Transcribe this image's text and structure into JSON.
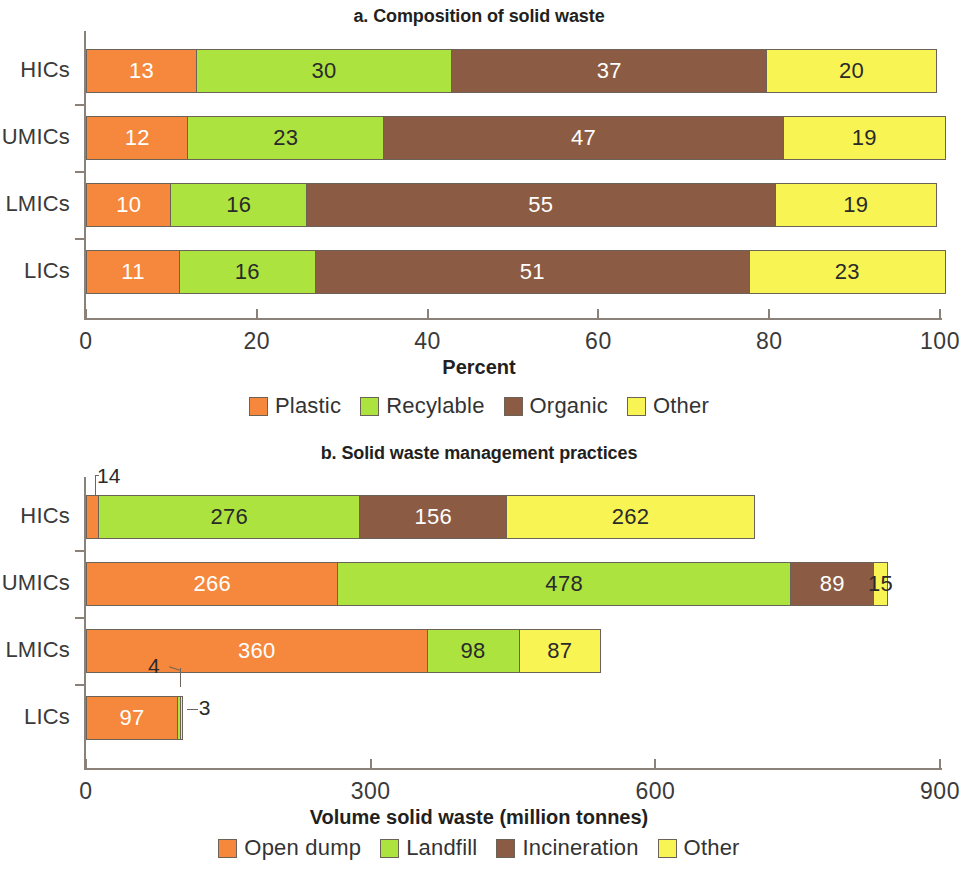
{
  "figure": {
    "background": "#ffffff",
    "palette": {
      "plastic_open_dump": "#F5883C",
      "recyclable_landfill": "#ADE33F",
      "organic_incineration": "#8B5B43",
      "other": "#F8F453",
      "axis": "#8A8279",
      "text": "#333333",
      "value_dark": "#2A2A2A",
      "value_light": "#FFFFFF"
    }
  },
  "panel_a": {
    "title": "a. Composition of solid waste",
    "xlabel": "Percent",
    "categories": [
      "HICs",
      "UMICs",
      "LMICs",
      "LICs"
    ],
    "xticks": [
      "0",
      "20",
      "40",
      "60",
      "80",
      "100"
    ],
    "legend": [
      {
        "label": "Plastic",
        "color": "#F5883C"
      },
      {
        "label": "Recylable",
        "color": "#ADE33F"
      },
      {
        "label": "Organic",
        "color": "#8B5B43"
      },
      {
        "label": "Other",
        "color": "#F8F453"
      }
    ]
  },
  "panel_b": {
    "title": "b. Solid waste management practices",
    "xlabel": "Volume solid waste (million tonnes)",
    "categories": [
      "HICs",
      "UMICs",
      "LMICs",
      "LICs"
    ],
    "xticks": [
      "0",
      "300",
      "600",
      "900"
    ],
    "legend": [
      {
        "label": "Open dump",
        "color": "#F5883C"
      },
      {
        "label": "Landfill",
        "color": "#ADE33F"
      },
      {
        "label": "Incineration",
        "color": "#8B5B43"
      },
      {
        "label": "Other",
        "color": "#F8F453"
      }
    ]
  },
  "chart_data": [
    {
      "type": "bar",
      "orientation": "horizontal",
      "stacked": true,
      "title": "a. Composition of solid waste",
      "xlabel": "Percent",
      "ylabel": "",
      "xlim": [
        0,
        100
      ],
      "xticks": [
        0,
        20,
        40,
        60,
        80,
        100
      ],
      "grid": false,
      "legend_position": "bottom",
      "categories": [
        "HICs",
        "UMICs",
        "LMICs",
        "LICs"
      ],
      "series": [
        {
          "name": "Plastic",
          "color": "#F5883C",
          "values": [
            13,
            12,
            10,
            11
          ]
        },
        {
          "name": "Recylable",
          "color": "#ADE33F",
          "values": [
            30,
            23,
            16,
            16
          ]
        },
        {
          "name": "Organic",
          "color": "#8B5B43",
          "values": [
            37,
            47,
            55,
            51
          ]
        },
        {
          "name": "Other",
          "color": "#F8F453",
          "values": [
            20,
            19,
            19,
            23
          ]
        }
      ]
    },
    {
      "type": "bar",
      "orientation": "horizontal",
      "stacked": true,
      "title": "b. Solid waste management practices",
      "xlabel": "Volume solid waste (million tonnes)",
      "ylabel": "",
      "xlim": [
        0,
        900
      ],
      "xticks": [
        0,
        300,
        600,
        900
      ],
      "grid": false,
      "legend_position": "bottom",
      "categories": [
        "HICs",
        "UMICs",
        "LMICs",
        "LICs"
      ],
      "series": [
        {
          "name": "Open dump",
          "color": "#F5883C",
          "values": [
            14,
            266,
            360,
            97
          ]
        },
        {
          "name": "Landfill",
          "color": "#ADE33F",
          "values": [
            276,
            478,
            98,
            4
          ]
        },
        {
          "name": "Incineration",
          "color": "#8B5B43",
          "values": [
            156,
            89,
            0,
            0
          ]
        },
        {
          "name": "Other",
          "color": "#F8F453",
          "values": [
            262,
            15,
            87,
            3
          ]
        }
      ],
      "annotations": [
        {
          "text": "14",
          "category": "HICs",
          "series": "Open dump",
          "style": "leader-callout-above-left"
        },
        {
          "text": "4",
          "category": "LICs",
          "series": "Landfill",
          "style": "leader-callout-above-left"
        },
        {
          "text": "3",
          "category": "LICs",
          "series": "Other",
          "style": "leader-callout-right"
        }
      ]
    }
  ]
}
